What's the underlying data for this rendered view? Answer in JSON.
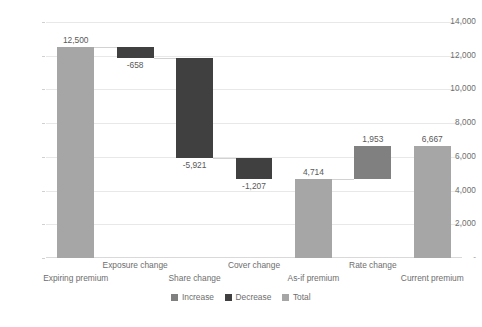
{
  "chart_data": {
    "type": "bar",
    "subtype": "waterfall",
    "title": "",
    "xlabel": "",
    "ylabel": "",
    "categories": [
      "Expiring premium",
      "Exposure change",
      "Share change",
      "Cover change",
      "As-if premium",
      "Rate change",
      "Current premium"
    ],
    "values": [
      12500,
      -658,
      -5921,
      -1207,
      4714,
      1953,
      6667
    ],
    "data_labels": [
      "12,500",
      "-658",
      "-5,921",
      "-1,207",
      "4,714",
      "1,953",
      "6,667"
    ],
    "kinds": [
      "total",
      "decrease",
      "decrease",
      "decrease",
      "total",
      "increase",
      "total"
    ],
    "bar_bases": [
      0,
      11842,
      5921,
      4714,
      0,
      4714,
      0
    ],
    "bar_tops": [
      12500,
      12500,
      11842,
      5921,
      4714,
      6667,
      6667
    ],
    "ylim": [
      0,
      14000
    ],
    "ytick_values": [
      14000,
      12000,
      10000,
      8000,
      6000,
      4000,
      2000,
      0
    ],
    "ytick_labels": [
      "14,000",
      "12,000",
      "10,000",
      "8,000",
      "6,000",
      "4,000",
      "2,000",
      "-"
    ],
    "grid": true,
    "grid_axis": "y",
    "legend_position": "bottom",
    "legend": [
      {
        "label": "Increase",
        "color": "#808080"
      },
      {
        "label": "Decrease",
        "color": "#404040"
      },
      {
        "label": "Total",
        "color": "#a6a6a6"
      }
    ],
    "label_positions": [
      "above",
      "below",
      "below",
      "below",
      "above",
      "above",
      "above"
    ],
    "xlabel_rows": [
      1,
      0,
      1,
      0,
      1,
      0,
      1
    ]
  },
  "colors": {
    "increase": "#808080",
    "decrease": "#404040",
    "total": "#a6a6a6",
    "gridline": "#e8e8e8",
    "axis_text": "#6e6e6e",
    "label_text": "#595959",
    "connector": "#d2d2d2",
    "background": "#ffffff"
  },
  "footer": {
    "artifact_text": ""
  }
}
